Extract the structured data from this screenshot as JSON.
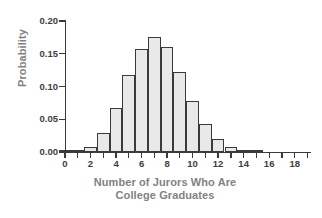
{
  "chart_data": {
    "type": "bar",
    "title": "",
    "xlabel": "Number of Jurors Who Are College Graduates",
    "xlabel_line1": "Number of Jurors Who Are",
    "xlabel_line2": "College Graduates",
    "ylabel": "Probability",
    "categories": [
      0,
      1,
      2,
      3,
      4,
      5,
      6,
      7,
      8,
      9,
      10,
      11,
      12,
      13,
      14,
      15
    ],
    "values": [
      0.0,
      0.003,
      0.008,
      0.029,
      0.067,
      0.118,
      0.158,
      0.176,
      0.16,
      0.122,
      0.078,
      0.043,
      0.02,
      0.007,
      0.002,
      0.001
    ],
    "xlim": [
      0,
      19.2
    ],
    "ylim": [
      0.0,
      0.2
    ],
    "xticks": [
      0,
      1,
      2,
      3,
      4,
      5,
      6,
      7,
      8,
      9,
      10,
      11,
      12,
      13,
      14,
      15,
      16,
      17,
      18,
      19
    ],
    "xtick_labels": [
      {
        "value": 0,
        "label": "0"
      },
      {
        "value": 2,
        "label": "2"
      },
      {
        "value": 4,
        "label": "4"
      },
      {
        "value": 6,
        "label": "6"
      },
      {
        "value": 8,
        "label": "8"
      },
      {
        "value": 10,
        "label": "10"
      },
      {
        "value": 12,
        "label": "12"
      },
      {
        "value": 14,
        "label": "14"
      },
      {
        "value": 16,
        "label": "16"
      },
      {
        "value": 18,
        "label": "18"
      }
    ],
    "yticks": [
      0.0,
      0.05,
      0.1,
      0.15,
      0.2
    ],
    "ytick_labels": [
      "0.00",
      "0.05",
      "0.10",
      "0.15",
      "0.20"
    ],
    "grid": false,
    "legend": false,
    "bar_fill_color": "#e9e9e9",
    "bar_edge_color": "#3a3a3a",
    "axis_color": "#3a3a3a",
    "tick_label_color": "#3d3d3d",
    "axis_title_color": "#828282"
  }
}
